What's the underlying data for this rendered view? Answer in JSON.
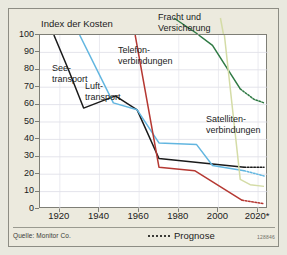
{
  "figure": {
    "background_color": "#eceade",
    "plot_background_color": "#ffffff",
    "source_note": "Quelle: Monitor Co.",
    "figure_code": "128846",
    "legend": {
      "forecast_label": "Prognose",
      "forecast_style": "dotted"
    }
  },
  "chart_data": {
    "type": "line",
    "title": "",
    "ylabel": "Index der Kosten",
    "xlabel": "",
    "xlim": [
      1910,
      2025
    ],
    "ylim": [
      0,
      100
    ],
    "grid": true,
    "legend_position": "inline-labels",
    "x_ticks": [
      "1920",
      "1940",
      "1960",
      "1980",
      "2000",
      "2020*"
    ],
    "x_tick_values": [
      1920,
      1940,
      1960,
      1980,
      2000,
      2020
    ],
    "y_ticks": [
      "0",
      "10",
      "20",
      "30",
      "40",
      "50",
      "60",
      "70",
      "80",
      "90",
      "100"
    ],
    "y_tick_values": [
      0,
      10,
      20,
      30,
      40,
      50,
      60,
      70,
      80,
      90,
      100
    ],
    "annotations": [
      {
        "id": "see",
        "text": "See-\ntransport"
      },
      {
        "id": "luft",
        "text": "Luft-\ntransport"
      },
      {
        "id": "tele",
        "text": "Telefon-\nverbindungen"
      },
      {
        "id": "fracht",
        "text": "Fracht und\nVersicherung"
      },
      {
        "id": "sat",
        "text": "Satelliten-\nverbindungen"
      }
    ],
    "series": [
      {
        "name": "Seetransport",
        "color": "#1a1a1a",
        "solid": [
          {
            "x": 1917,
            "y": 100
          },
          {
            "x": 1924,
            "y": 81
          },
          {
            "x": 1932,
            "y": 58
          },
          {
            "x": 1948,
            "y": 65
          },
          {
            "x": 1959,
            "y": 57
          },
          {
            "x": 1970,
            "y": 29
          },
          {
            "x": 2013,
            "y": 24
          }
        ],
        "forecast": [
          {
            "x": 2013,
            "y": 24
          },
          {
            "x": 2023,
            "y": 24
          }
        ]
      },
      {
        "name": "Lufttransport",
        "color": "#62b6e0",
        "solid": [
          {
            "x": 1930,
            "y": 100
          },
          {
            "x": 1947,
            "y": 61
          },
          {
            "x": 1959,
            "y": 57
          },
          {
            "x": 1970,
            "y": 38
          },
          {
            "x": 1989,
            "y": 37
          },
          {
            "x": 1997,
            "y": 25
          },
          {
            "x": 2013,
            "y": 22
          }
        ],
        "forecast": [
          {
            "x": 2013,
            "y": 22
          },
          {
            "x": 2023,
            "y": 19
          }
        ]
      },
      {
        "name": "Telefonverbindungen",
        "color": "#b53832",
        "solid": [
          {
            "x": 1958,
            "y": 100
          },
          {
            "x": 1970,
            "y": 24
          },
          {
            "x": 1988,
            "y": 22
          },
          {
            "x": 2012,
            "y": 5
          }
        ],
        "forecast": [
          {
            "x": 2012,
            "y": 5
          },
          {
            "x": 2023,
            "y": 3
          }
        ]
      },
      {
        "name": "Fracht und Versicherung",
        "color": "#2f7a44",
        "solid": [
          {
            "x": 1990,
            "y": 100
          },
          {
            "x": 1997,
            "y": 94
          },
          {
            "x": 2011,
            "y": 69
          }
        ],
        "forecast": [
          {
            "x": 2011,
            "y": 69
          },
          {
            "x": 2018,
            "y": 63
          },
          {
            "x": 2023,
            "y": 61
          }
        ]
      },
      {
        "name": "Satellitenverbindungen",
        "color": "#d4dca6",
        "solid": [
          {
            "x": 2003,
            "y": 100
          },
          {
            "x": 2011,
            "y": 17
          },
          {
            "x": 2016,
            "y": 14
          },
          {
            "x": 2023,
            "y": 13
          }
        ],
        "forecast": []
      }
    ]
  }
}
